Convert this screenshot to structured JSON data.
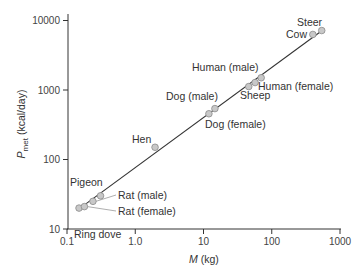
{
  "chart_data": {
    "type": "scatter",
    "title": "",
    "xlabel": "M (kg)",
    "xlabel_italic": "M",
    "xlabel_unit": "(kg)",
    "ylabel": "P_met (kcal/day)",
    "ylabel_main": "P",
    "ylabel_sub": "met",
    "ylabel_unit": "(kcal/day)",
    "xscale": "log",
    "yscale": "log",
    "xlim": [
      0.1,
      1000
    ],
    "ylim": [
      10,
      10000
    ],
    "xticks": [
      "0.1",
      "1.0",
      "10",
      "100",
      "1000"
    ],
    "yticks": [
      "10",
      "100",
      "1000",
      "10000"
    ],
    "grid": false,
    "legend": false,
    "fit_line": {
      "x": [
        0.14,
        560
      ],
      "y": [
        18.5,
        7300
      ]
    },
    "points": [
      {
        "label": "Ring dove",
        "x": 0.15,
        "y": 20
      },
      {
        "label": "Rat (female)",
        "x": 0.18,
        "y": 21
      },
      {
        "label": "Rat (male)",
        "x": 0.24,
        "y": 25
      },
      {
        "label": "Pigeon",
        "x": 0.31,
        "y": 30
      },
      {
        "label": "Hen",
        "x": 1.95,
        "y": 150
      },
      {
        "label": "Dog (female)",
        "x": 12,
        "y": 455
      },
      {
        "label": "Dog (male)",
        "x": 14.7,
        "y": 540
      },
      {
        "label": "Sheep",
        "x": 46,
        "y": 1120
      },
      {
        "label": "Human (female)",
        "x": 57,
        "y": 1280
      },
      {
        "label": "Human (male)",
        "x": 70,
        "y": 1500
      },
      {
        "label": "Cow",
        "x": 400,
        "y": 6300
      },
      {
        "label": "Steer",
        "x": 540,
        "y": 7170
      }
    ],
    "point_color": "#c8c8c8",
    "point_stroke": "#8a8a8a",
    "line_color": "#333333"
  }
}
